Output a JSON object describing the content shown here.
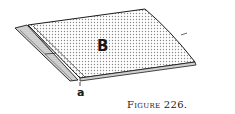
{
  "figure": {
    "caption": "Figure 226.",
    "labels": {
      "sheet": "B",
      "fold": "a"
    },
    "colors": {
      "ink": "#1a1a1a",
      "stipple": "#9a9a9a",
      "background": "#ffffff"
    }
  }
}
